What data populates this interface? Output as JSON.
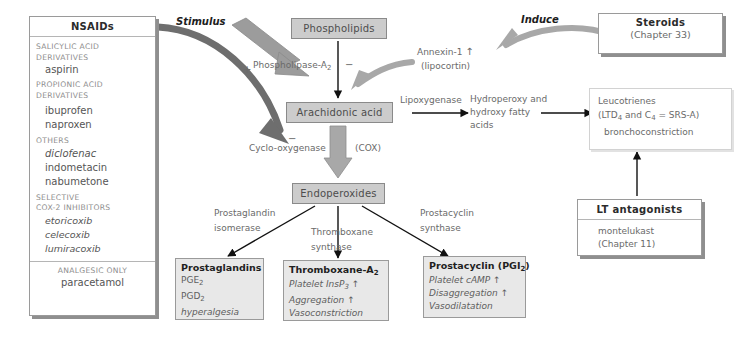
{
  "nsaids_box": {
    "header": "NSAIDs",
    "groups": [
      {
        "category": "SALICYLIC ACID\nDERIVATIVES",
        "drugs": [
          "aspirin"
        ]
      },
      {
        "category": "PROPIONIC ACID\nDERIVATIVES",
        "drugs": [
          "ibuprofen",
          "naproxen"
        ]
      },
      {
        "category": "OTHERS",
        "drugs": [
          "diclofenac",
          "indometacin",
          "nabumetone"
        ]
      },
      {
        "category": "SELECTIVE\nCOX-2 INHIBITORS",
        "drugs": [
          "etoricoxib",
          "celecoxib",
          "lumiracoxib"
        ]
      }
    ],
    "footer_category": "ANALGESIC ONLY",
    "footer_drug": "paracetamol"
  },
  "steroids_box": {
    "header": "Steroids",
    "reference": "(Chapter 33)"
  },
  "lt_antagonists_box": {
    "header": "LT antagonists",
    "drug": "montelukast",
    "reference": "(Chapter 11)"
  },
  "spine": {
    "phospholipids": "Phospholipids",
    "arachidonic_acid": "Arachidonic acid",
    "endoperoxides": "Endoperoxides"
  },
  "labels": {
    "stimulus": "Stimulus",
    "induce": "Induce",
    "plus_sign": "+",
    "minus_sign": "−",
    "phospholipase": "Phospholipase-A",
    "phospholipase_sub": "2",
    "annexin": "Annexin-1",
    "annexin_arrow": "↑",
    "lipocortin": "(lipocortin)",
    "cyclo_oxygenase": "Cyclo-oxygenase",
    "cox": "(COX)",
    "cox_minus": "−",
    "lipoxygenase": "Lipoxygenase",
    "hydroperoxy": "Hydroperoxy and\nhydroxy fatty\nacids",
    "prostaglandin_isomerase": "Prostaglandin\nisomerase",
    "thromboxane_synthase": "Thromboxane\nsynthase",
    "prostacyclin_synthase": "Prostacyclin\nsynthase"
  },
  "leucotrienes_box": {
    "line1": "Leucotrienes",
    "line2_pre": "(LTD",
    "line2_sub1": "4",
    "line2_mid": " and C",
    "line2_sub2": "4",
    "line2_post": " = SRS-A)",
    "line3": "bronchoconstriction"
  },
  "products": [
    {
      "title": "Prostaglandins",
      "lines": [
        "PGE₂",
        "PGD₂",
        "hyperalgesia"
      ],
      "title_plain": "Prostaglandins",
      "l1_pre": "PGE",
      "l1_sub": "2",
      "l2_pre": "PGD",
      "l2_sub": "2",
      "l3": "hyperalgesia"
    },
    {
      "title_pre": "Thromboxane-A",
      "title_sub": "2",
      "l1_pre": "Platelet InsP",
      "l1_sub": "3",
      "l1_arrow": "↑",
      "l2": "Aggregation",
      "l2_arrow": "↑",
      "l3": "Vasoconstriction"
    },
    {
      "title_pre": "Prostacyclin (PGI",
      "title_sub": "2",
      "title_post": ")",
      "l1": "Platelet cAMP",
      "l1_arrow": "↑",
      "l2": "Disaggregation",
      "l2_arrow": "↑",
      "l3": "Vasodilatation"
    }
  ],
  "colors": {
    "grey_box_fill": "#cccccc",
    "grey_box_border": "#8a8a8a",
    "product_fill": "#e8e8e8",
    "thick_arrow_dark": "#6e6e6e",
    "thick_arrow_light": "#a8a8a8",
    "thin_arrow": "#111111",
    "text_grey": "#6a6a6a",
    "shadow": "#8f8f8f"
  }
}
